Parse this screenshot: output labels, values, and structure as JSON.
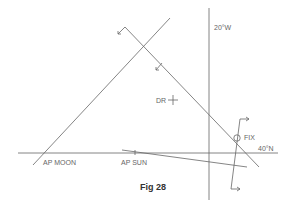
{
  "figure": {
    "caption": "Fig 28",
    "labels": {
      "meridian": "20°W",
      "parallel": "40°N",
      "dr": "DR",
      "fix": "FIX",
      "ap_moon": "AP MOON",
      "ap_sun": "AP SUN"
    },
    "colors": {
      "line": "#555555",
      "text": "#666666",
      "caption": "#333333"
    }
  }
}
